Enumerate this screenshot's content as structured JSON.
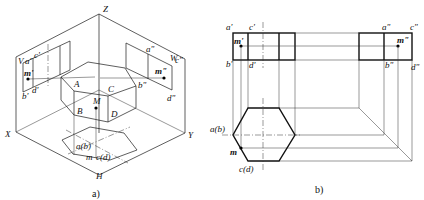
{
  "figure_a": {
    "caption": "a)",
    "axes": {
      "z": "Z",
      "x": "X",
      "y": "Y"
    },
    "planes": {
      "v": "V",
      "w": "W",
      "h": "H"
    },
    "solid_vertices": {
      "a": "A",
      "b": "B",
      "c": "C",
      "d": "D",
      "m": "M"
    },
    "v_projection": {
      "a": "a'",
      "b": "b'",
      "c": "c'",
      "d": "d'",
      "m": "m'"
    },
    "w_projection": {
      "a": "a\"",
      "b": "b\"",
      "c": "c\"",
      "d": "d\"",
      "m": "m\""
    },
    "h_projection": {
      "ab": "a(b)",
      "cd": "c(d)",
      "m": "m"
    }
  },
  "figure_b": {
    "caption": "b)",
    "front_view": {
      "a": "a'",
      "b": "b'",
      "c": "c'",
      "d": "d'",
      "m": "m'"
    },
    "side_view": {
      "a": "a\"",
      "b": "b\"",
      "c": "c\"",
      "d": "d\"",
      "m": "m\""
    },
    "top_view": {
      "ab": "a(b)",
      "cd": "c(d)",
      "m": "m"
    }
  }
}
